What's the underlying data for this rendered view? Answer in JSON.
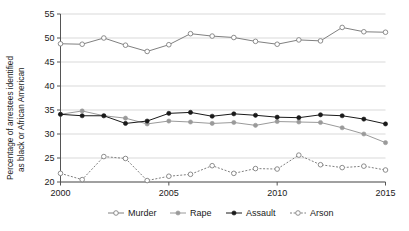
{
  "chart_data": {
    "type": "line",
    "title": "",
    "xlabel": "",
    "ylabel": "Percentage of arrestees identified as black or African American",
    "ylabel_line1": "Percentage of arrestees identified",
    "ylabel_line2": "as black or African American",
    "x": [
      2000,
      2001,
      2002,
      2003,
      2004,
      2005,
      2006,
      2007,
      2008,
      2009,
      2010,
      2011,
      2012,
      2013,
      2014,
      2015
    ],
    "xticks": [
      2000,
      2005,
      2010,
      2015
    ],
    "xtick_labels": [
      "2000",
      "2005",
      "2010",
      "2015"
    ],
    "yticks": [
      20,
      25,
      30,
      35,
      40,
      45,
      50,
      55
    ],
    "ytick_labels": [
      "20",
      "25",
      "30",
      "35",
      "40",
      "45",
      "50",
      "55"
    ],
    "xlim": [
      2000,
      2015
    ],
    "ylim": [
      20,
      55
    ],
    "grid": true,
    "grid_axis": "y",
    "legend_position": "bottom",
    "series": [
      {
        "name": "Murder",
        "marker": "open-circle",
        "line_style": "solid",
        "color": "#808080",
        "values": [
          48.8,
          48.7,
          50.0,
          48.5,
          47.2,
          48.6,
          50.9,
          50.4,
          50.1,
          49.3,
          48.7,
          49.6,
          49.4,
          52.2,
          51.3,
          51.2
        ]
      },
      {
        "name": "Rape",
        "marker": "filled-circle",
        "line_style": "solid",
        "color": "#9a9a9a",
        "values": [
          34.1,
          34.8,
          33.8,
          33.3,
          32.1,
          32.7,
          32.5,
          32.2,
          32.4,
          31.8,
          32.6,
          32.5,
          32.4,
          31.3,
          30.0,
          28.2
        ]
      },
      {
        "name": "Assault",
        "marker": "filled-circle",
        "line_style": "solid",
        "color": "#1a1a1a",
        "values": [
          34.1,
          33.8,
          33.8,
          32.2,
          32.7,
          34.3,
          34.5,
          33.7,
          34.2,
          33.9,
          33.5,
          33.4,
          34.0,
          33.8,
          33.1,
          32.1
        ]
      },
      {
        "name": "Arson",
        "marker": "open-circle",
        "line_style": "dotted",
        "color": "#808080",
        "values": [
          21.8,
          20.5,
          25.3,
          24.9,
          20.3,
          21.2,
          21.6,
          23.4,
          21.8,
          22.8,
          22.7,
          25.6,
          23.6,
          23.0,
          23.3,
          22.5
        ]
      }
    ]
  },
  "legend": {
    "items": [
      {
        "label": "Murder"
      },
      {
        "label": "Rape"
      },
      {
        "label": "Assault"
      },
      {
        "label": "Arson"
      }
    ]
  },
  "colors": {
    "background": "#ffffff",
    "grid": "#c8c8c8",
    "axis": "#555555",
    "text": "#1a1a1a",
    "murder": "#808080",
    "rape": "#9a9a9a",
    "assault": "#1a1a1a",
    "arson": "#808080"
  }
}
